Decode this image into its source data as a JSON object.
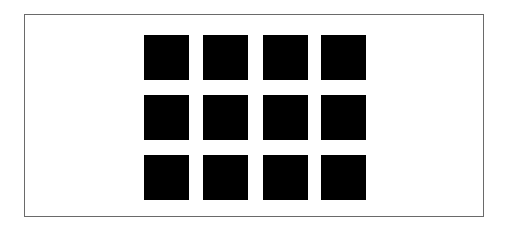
{
  "figure": {
    "frame_color": "#6a6a6a",
    "square_color": "#000000",
    "background_color": "#ffffff",
    "grid": {
      "rows": 3,
      "columns": 4,
      "column_x": [
        144,
        203,
        263,
        321
      ],
      "row_y": [
        35,
        95,
        155
      ],
      "square_size": 45
    }
  }
}
